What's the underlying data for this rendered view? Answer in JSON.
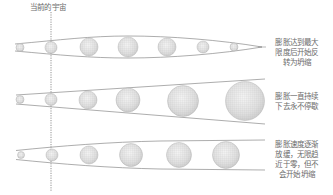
{
  "diagram": {
    "current_universe_label": "当前的宇宙",
    "scenarios": [
      {
        "id": "recollapse",
        "label": "膨胀达到最大\n限度后开始反\n转为坍缩",
        "sphere_radii": [
          4,
          6,
          9,
          10,
          9,
          6,
          4
        ]
      },
      {
        "id": "eternal-expansion",
        "label": "膨胀一直持续\n下去永不停歇",
        "sphere_radii": [
          4,
          6,
          9,
          12,
          15,
          19
        ]
      },
      {
        "id": "decelerating-expansion",
        "label": "膨胀速度逐渐\n放缓，无限趋\n近于零，但不\n会开始坍缩",
        "sphere_radii": [
          3.5,
          6,
          9,
          11,
          12,
          13
        ]
      }
    ],
    "colors": {
      "line": "#8a8a8a",
      "sphere_fill": "#e6e6e6",
      "sphere_grid": "#a0a0a0",
      "text": "#6b6b6b",
      "dashed_line": "#777777"
    }
  }
}
